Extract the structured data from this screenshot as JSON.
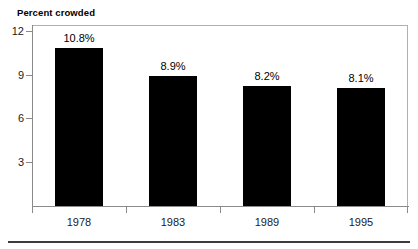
{
  "chart_data": {
    "type": "bar",
    "title": "",
    "xlabel": "",
    "ylabel": "Percent crowded",
    "categories": [
      "1978",
      "1983",
      "1989",
      "1995"
    ],
    "values": [
      10.8,
      8.9,
      8.2,
      8.1
    ],
    "data_labels": [
      "10.8%",
      "8.9%",
      "8.2%",
      "8.1%"
    ],
    "ylim": [
      0,
      12.4
    ],
    "yticks": [
      3,
      6,
      9,
      12
    ],
    "ytick_labels": [
      "3",
      "6",
      "9",
      "12"
    ],
    "grid": false,
    "legend": false,
    "bar_color": "#000000",
    "frame_color": "#b0b0b0",
    "axis_color": "#8a8a8a"
  },
  "figure": {
    "title_clipped": "",
    "axis_label_y": "Percent crowded"
  }
}
